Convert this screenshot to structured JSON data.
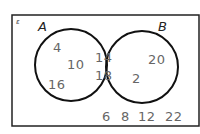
{
  "diagram": {
    "type": "venn",
    "universal_symbol": "ε",
    "sets": [
      {
        "label": "A"
      },
      {
        "label": "B"
      }
    ],
    "regions": {
      "a_only": [
        "4",
        "10",
        "16"
      ],
      "a_and_b": [
        "14",
        "18"
      ],
      "b_only": [
        "20",
        "2"
      ],
      "outside": [
        "6",
        "8",
        "12",
        "22"
      ]
    }
  }
}
